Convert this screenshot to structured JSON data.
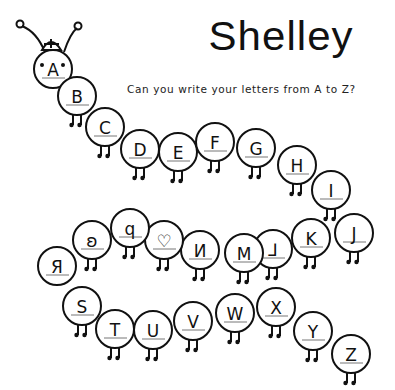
{
  "worksheet": {
    "name": "Shelley",
    "prompt": "Can you write your letters from A to Z?",
    "colors": {
      "ink": "#111111",
      "paper": "#ffffff"
    }
  },
  "caterpillar": {
    "head": {
      "letter": "A",
      "has_antennae": true,
      "has_hat": true,
      "has_eyes": true
    },
    "segments": [
      {
        "target": "A",
        "written": "A"
      },
      {
        "target": "B",
        "written": "B"
      },
      {
        "target": "C",
        "written": "C"
      },
      {
        "target": "D",
        "written": "D"
      },
      {
        "target": "E",
        "written": "E"
      },
      {
        "target": "F",
        "written": "F"
      },
      {
        "target": "G",
        "written": "G"
      },
      {
        "target": "H",
        "written": "H"
      },
      {
        "target": "I",
        "written": "I"
      },
      {
        "target": "J",
        "written": "J"
      },
      {
        "target": "K",
        "written": "K"
      },
      {
        "target": "L",
        "written": "⅃"
      },
      {
        "target": "M",
        "written": "M"
      },
      {
        "target": "N",
        "written": "И"
      },
      {
        "target": "O",
        "written": "♡"
      },
      {
        "target": "P",
        "written": "q"
      },
      {
        "target": "Q",
        "written": "ʚ"
      },
      {
        "target": "R",
        "written": "Я"
      },
      {
        "target": "S",
        "written": "S"
      },
      {
        "target": "T",
        "written": "T"
      },
      {
        "target": "U",
        "written": "U"
      },
      {
        "target": "V",
        "written": "V"
      },
      {
        "target": "W",
        "written": "W"
      },
      {
        "target": "X",
        "written": "X"
      },
      {
        "target": "Y",
        "written": "Y"
      },
      {
        "target": "Z",
        "written": "Z"
      }
    ]
  }
}
